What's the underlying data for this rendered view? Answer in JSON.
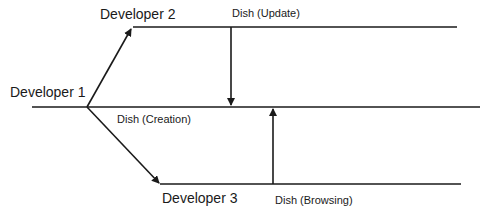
{
  "diagram": {
    "developers": [
      {
        "label": "Developer 1"
      },
      {
        "label": "Developer 2"
      },
      {
        "label": "Developer 3"
      }
    ],
    "actions": [
      {
        "label": "Dish (Update)"
      },
      {
        "label": "Dish (Creation)"
      },
      {
        "label": "Dish (Browsing)"
      }
    ],
    "colors": {
      "line": "#1a1a1a",
      "background": "#ffffff"
    }
  }
}
